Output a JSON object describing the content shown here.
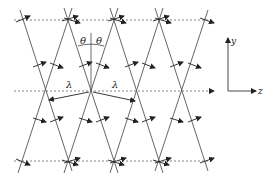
{
  "diagram": {
    "labels": {
      "theta_left": "θ",
      "theta_right": "θ",
      "lambda_left": "λ",
      "lambda_right": "λ",
      "axis_y": "y",
      "axis_z": "z"
    },
    "dashed_lines_y": [
      20,
      91,
      161
    ],
    "top_nodes_x": [
      22,
      68,
      114,
      159,
      204
    ],
    "mid_nodes_x": [
      45,
      91,
      137,
      182
    ],
    "colors": {
      "line": "#444444",
      "dashed": "#666666",
      "arrow": "#222222"
    }
  }
}
